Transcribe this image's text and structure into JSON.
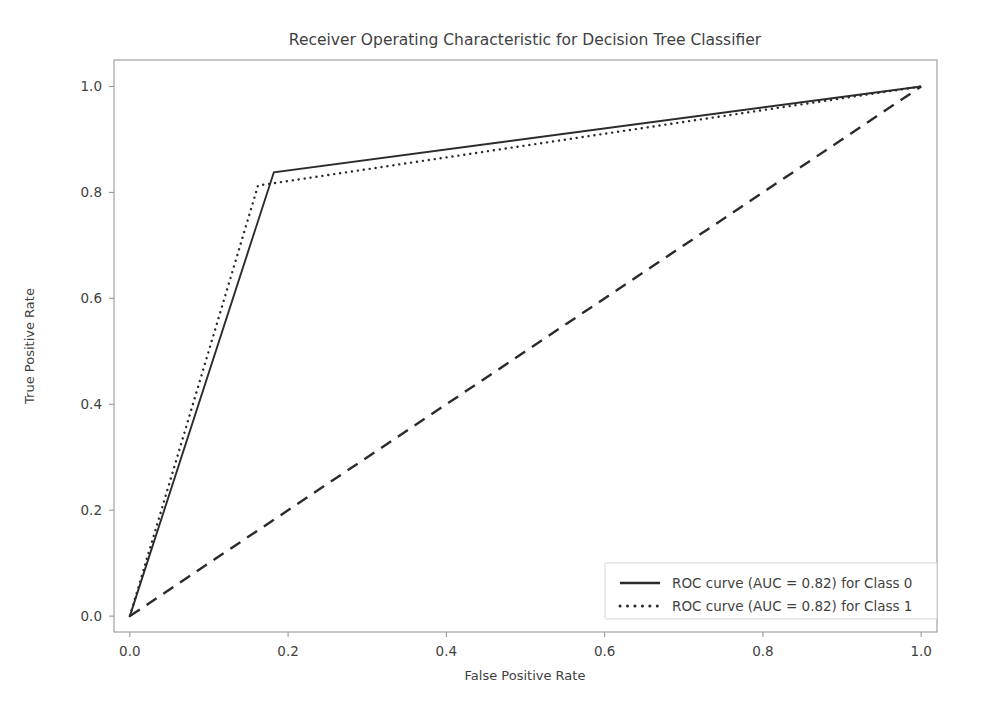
{
  "chart_data": {
    "type": "line",
    "title": "Receiver Operating Characteristic for Decision Tree Classifier",
    "xlabel": "False Positive Rate",
    "ylabel": "True Positive Rate",
    "xlim": [
      -0.02,
      1.02
    ],
    "ylim": [
      -0.03,
      1.05
    ],
    "xticks": [
      "0.0",
      "0.2",
      "0.4",
      "0.6",
      "0.8",
      "1.0"
    ],
    "xtick_values": [
      0.0,
      0.2,
      0.4,
      0.6,
      0.8,
      1.0
    ],
    "yticks": [
      "0.0",
      "0.2",
      "0.4",
      "0.6",
      "0.8",
      "1.0"
    ],
    "ytick_values": [
      0.0,
      0.2,
      0.4,
      0.6,
      0.8,
      1.0
    ],
    "grid": false,
    "legend_position": "lower right",
    "series": [
      {
        "name": "ROC curve (AUC = 0.82) for Class 0",
        "auc": "0.82",
        "class": "Class 0",
        "linestyle": "solid",
        "color": "#2b2b2b",
        "linewidth": 1.9,
        "x": [
          0.0,
          0.182,
          1.0
        ],
        "y": [
          0.0,
          0.838,
          1.0
        ]
      },
      {
        "name": "ROC curve (AUC = 0.82) for Class 1",
        "auc": "0.82",
        "class": "Class 1",
        "linestyle": "dotted",
        "color": "#2b2b2b",
        "linewidth": 2.4,
        "x": [
          0.0,
          0.162,
          1.0
        ],
        "y": [
          0.0,
          0.813,
          1.0
        ]
      }
    ],
    "reference_line": {
      "name": "chance-diagonal",
      "linestyle": "dashed",
      "color": "#2b2b2b",
      "linewidth": 2.4,
      "x": [
        0.0,
        1.0
      ],
      "y": [
        0.0,
        1.0
      ]
    }
  },
  "legend": {
    "entries": [
      {
        "label": "ROC curve (AUC = 0.82) for Class 0",
        "style": "solid"
      },
      {
        "label": "ROC curve (AUC = 0.82) for Class 1",
        "style": "dotted"
      }
    ]
  }
}
